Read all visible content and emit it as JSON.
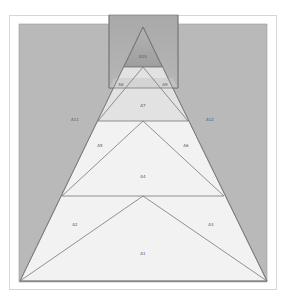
{
  "diagram": {
    "type": "nested-triangle-area-diagram",
    "colors": {
      "frame_border": "#d6d6d6",
      "panel": "#b9b9b9",
      "top_rect_top": "#a6a6a6",
      "top_rect_bottom": "#b3b3b3",
      "triangle_light": "#f2f2f2",
      "band_a7": "#dedede",
      "stroke": "#777777",
      "label": "#555555"
    },
    "regions": [
      {
        "id": "A1",
        "label": "A1",
        "x": 143,
        "y": 254
      },
      {
        "id": "A2",
        "label": "A2",
        "x": 75,
        "y": 225
      },
      {
        "id": "A3",
        "label": "A3",
        "x": 211,
        "y": 225
      },
      {
        "id": "A4",
        "label": "A4",
        "x": 143,
        "y": 177
      },
      {
        "id": "A5",
        "label": "A5",
        "x": 100,
        "y": 146
      },
      {
        "id": "A6",
        "label": "A6",
        "x": 186,
        "y": 146
      },
      {
        "id": "A7",
        "label": "A7",
        "x": 143,
        "y": 106
      },
      {
        "id": "A8",
        "label": "A8",
        "x": 121,
        "y": 85
      },
      {
        "id": "A9",
        "label": "A9",
        "x": 165,
        "y": 85
      },
      {
        "id": "A10",
        "label": "A10",
        "x": 143,
        "y": 57
      },
      {
        "id": "A11",
        "label": "A11",
        "x": 75,
        "y": 120
      },
      {
        "id": "A12",
        "label": "A12",
        "x": 210,
        "y": 120
      }
    ]
  }
}
